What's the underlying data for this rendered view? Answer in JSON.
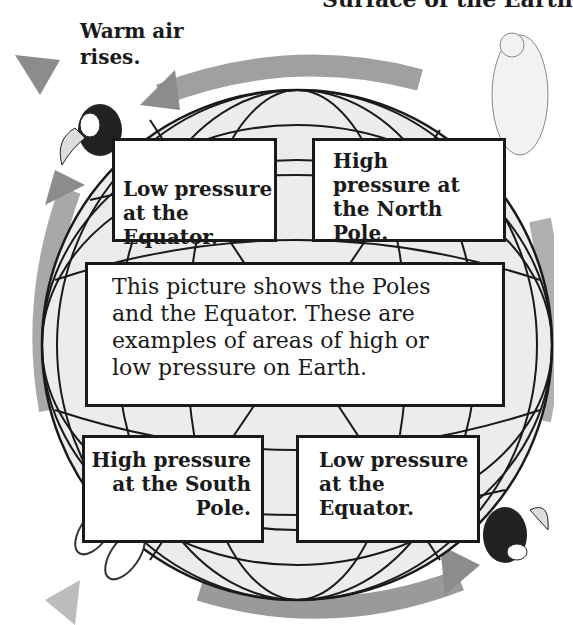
{
  "header": {
    "clipped_title": "Surface of the Earth"
  },
  "annotations": {
    "warm_air": "Warm air rises."
  },
  "boxes": {
    "top_left": {
      "line1": "Low pressure",
      "line2": "at the Equator."
    },
    "top_right": {
      "line1": "High",
      "line2": "pressure at",
      "line3": "the North Pole."
    },
    "center": {
      "line1": "This picture shows the Poles",
      "line2": "and the Equator. These are",
      "line3": "examples of areas of high or",
      "line4": "low pressure on Earth."
    },
    "bottom_left": {
      "line1": "High pressure",
      "line2": "at the South",
      "line3": "Pole."
    },
    "bottom_right": {
      "line1": "Low pressure",
      "line2": "at the Equator."
    }
  },
  "illustrations": [
    "toucan",
    "polar-bear",
    "penguins",
    "toucan"
  ],
  "colors": {
    "arrow": "#8a8a8a",
    "arrow_light": "#c8c8c8",
    "globe_fill": "#eeeeee",
    "line": "#1a1a1a"
  }
}
